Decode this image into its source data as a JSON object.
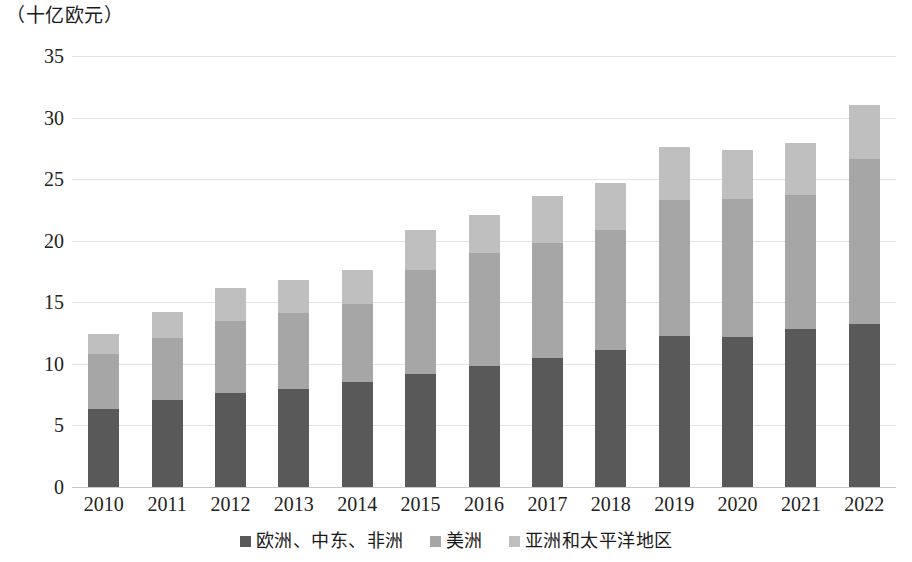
{
  "chart_data": {
    "type": "bar",
    "subtype": "stacked-vertical",
    "title": "（十亿欧元）",
    "xlabel": "",
    "ylabel": "",
    "unit_note": "（十亿欧元）",
    "ylim": [
      0,
      35
    ],
    "yticks": [
      0,
      5,
      10,
      15,
      20,
      25,
      30,
      35
    ],
    "ytick_labels": [
      "0",
      "5",
      "10",
      "15",
      "20",
      "25",
      "30",
      "35"
    ],
    "grid": true,
    "grid_axis": "y",
    "legend_position": "bottom-center",
    "categories": [
      "2010",
      "2011",
      "2012",
      "2013",
      "2014",
      "2015",
      "2016",
      "2017",
      "2018",
      "2019",
      "2020",
      "2021",
      "2022"
    ],
    "series": [
      {
        "name": "欧洲、中东、非洲",
        "color": "#595959",
        "values": [
          6.3,
          7.1,
          7.6,
          8.0,
          8.5,
          9.2,
          9.8,
          10.5,
          11.1,
          12.3,
          12.2,
          12.8,
          13.2
        ]
      },
      {
        "name": "美洲",
        "color": "#a6a6a6",
        "values": [
          4.5,
          5.0,
          5.9,
          6.1,
          6.4,
          8.4,
          9.2,
          9.3,
          9.8,
          11.0,
          11.2,
          10.9,
          13.4
        ]
      },
      {
        "name": "亚洲和太平洋地区",
        "color": "#bfbfbf",
        "values": [
          1.6,
          2.1,
          2.7,
          2.7,
          2.7,
          3.3,
          3.1,
          3.8,
          3.8,
          4.3,
          4.0,
          4.2,
          4.4
        ]
      }
    ],
    "totals": [
      12.4,
      14.2,
      16.2,
      16.8,
      17.6,
      20.9,
      22.1,
      23.6,
      24.7,
      27.6,
      27.4,
      27.9,
      31.0
    ]
  },
  "legend": {
    "items": [
      {
        "label": "欧洲、中东、非洲",
        "color": "#595959"
      },
      {
        "label": "美洲",
        "color": "#a6a6a6"
      },
      {
        "label": "亚洲和太平洋地区",
        "color": "#bfbfbf"
      }
    ]
  }
}
